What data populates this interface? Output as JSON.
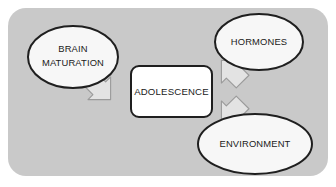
{
  "diagram": {
    "panel": {
      "background_color": "#c9c9c9",
      "corner_radius": 18
    },
    "center_node": {
      "label": "ADOLESCENCE",
      "shape": "rounded-rectangle",
      "fill_color": "#ffffff",
      "border_color": "#1f1f1f"
    },
    "source_nodes": [
      {
        "id": "brain-maturation",
        "label_lines": [
          "BRAIN",
          "MATURATION"
        ],
        "label": "BRAIN MATURATION",
        "shape": "ellipse",
        "fill_color": "#f7f7f7",
        "border_color": "#1f1f1f",
        "position": "left"
      },
      {
        "id": "hormones",
        "label_lines": [
          "HORMONES"
        ],
        "label": "HORMONES",
        "shape": "ellipse",
        "fill_color": "#f7f7f7",
        "border_color": "#1f1f1f",
        "position": "top-right"
      },
      {
        "id": "environment",
        "label_lines": [
          "ENVIRONMENT"
        ],
        "label": "ENVIRONMENT",
        "shape": "ellipse",
        "fill_color": "#f7f7f7",
        "border_color": "#1f1f1f",
        "position": "bottom-right"
      }
    ],
    "arrows": [
      {
        "id": "arrow-brain-to-adolescence",
        "from": "brain-maturation",
        "to": "center_node",
        "direction": "down-right",
        "fill_color": "#e3e3e3",
        "border_color": "#9a9a9a"
      },
      {
        "id": "arrow-hormones-to-adolescence",
        "from": "hormones",
        "to": "center_node",
        "direction": "down-left",
        "fill_color": "#e3e3e3",
        "border_color": "#9a9a9a"
      },
      {
        "id": "arrow-environment-to-adolescence",
        "from": "environment",
        "to": "center_node",
        "direction": "up-left",
        "fill_color": "#e3e3e3",
        "border_color": "#9a9a9a"
      }
    ]
  }
}
